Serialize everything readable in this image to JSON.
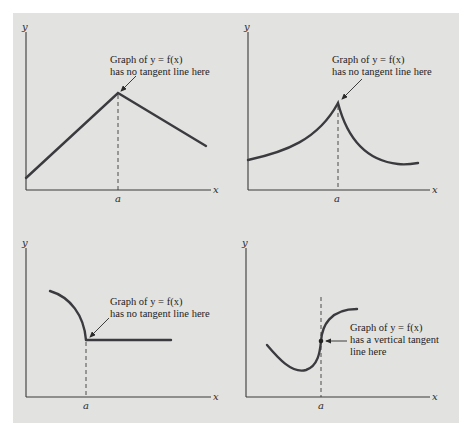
{
  "figure": {
    "axis_labels": {
      "x": "x",
      "y": "y",
      "a": "a"
    },
    "panels": [
      {
        "id": "peak-corner",
        "description": "Piecewise linear graph with a corner at x = a",
        "annotation": [
          "Graph of y = f(x)",
          "has no tangent line here"
        ]
      },
      {
        "id": "cusp",
        "description": "Curved graph with a cusp at x = a",
        "annotation": [
          "Graph of y = f(x)",
          "has no tangent line here"
        ]
      },
      {
        "id": "arc-then-flat",
        "description": "Arc meeting a horizontal line at x = a",
        "annotation": [
          "Graph of y = f(x)",
          "has no tangent line here"
        ]
      },
      {
        "id": "vertical-tangent",
        "description": "S-shaped curve with a vertical tangent at x = a",
        "annotation": [
          "Graph of y = f(x)",
          "has a vertical tangent",
          "line here"
        ]
      }
    ]
  }
}
